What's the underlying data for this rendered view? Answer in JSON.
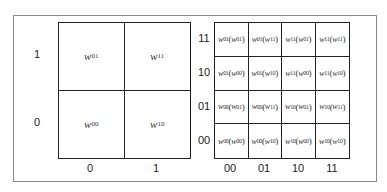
{
  "left_diagram": {
    "y_labels": [
      "1",
      "0"
    ],
    "x_labels": [
      "0",
      "1"
    ],
    "cells": [
      [
        {
          "var": "w",
          "sub": "01"
        },
        {
          "var": "w",
          "sub": "11"
        }
      ],
      [
        {
          "var": "w",
          "sub": "00"
        },
        {
          "var": "w",
          "sub": "10"
        }
      ]
    ]
  },
  "right_diagram": {
    "y_labels": [
      "11",
      "10",
      "01",
      "00"
    ],
    "x_labels": [
      "00",
      "01",
      "10",
      "11"
    ],
    "cells": [
      [
        {
          "outer": "01",
          "inner": "01"
        },
        {
          "outer": "01",
          "inner": "11"
        },
        {
          "outer": "11",
          "inner": "01"
        },
        {
          "outer": "11",
          "inner": "11"
        }
      ],
      [
        {
          "outer": "01",
          "inner": "00"
        },
        {
          "outer": "01",
          "inner": "10"
        },
        {
          "outer": "11",
          "inner": "00"
        },
        {
          "outer": "11",
          "inner": "10"
        }
      ],
      [
        {
          "outer": "00",
          "inner": "01"
        },
        {
          "outer": "00",
          "inner": "11"
        },
        {
          "outer": "10",
          "inner": "01"
        },
        {
          "outer": "10",
          "inner": "11"
        }
      ],
      [
        {
          "outer": "00",
          "inner": "00"
        },
        {
          "outer": "00",
          "inner": "10"
        },
        {
          "outer": "10",
          "inner": "00"
        },
        {
          "outer": "10",
          "inner": "10"
        }
      ]
    ]
  }
}
